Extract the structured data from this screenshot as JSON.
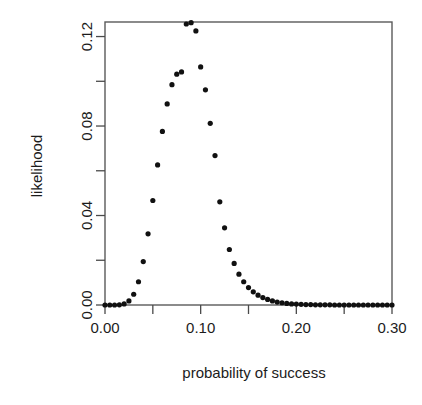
{
  "chart_data": {
    "type": "scatter",
    "title": "",
    "xlabel": "probability of success",
    "ylabel": "likelihood",
    "xlim": [
      0.0,
      0.3
    ],
    "ylim": [
      0.0,
      0.1265
    ],
    "grid": false,
    "legend": null,
    "x_tick_labels": [
      "0.00",
      "0.10",
      "0.20",
      "0.30"
    ],
    "x_tick_values": [
      0.0,
      0.1,
      0.2,
      0.3
    ],
    "x_minor_tick_values": [
      0.05,
      0.15,
      0.25
    ],
    "y_tick_labels": [
      "0.00",
      "0.04",
      "0.08",
      "0.12"
    ],
    "y_tick_values": [
      0.0,
      0.04,
      0.08,
      0.12
    ],
    "y_minor_tick_values": [
      0.02,
      0.06,
      0.1
    ],
    "point_marker": "filled-circle",
    "point_color": "#111111",
    "x": [
      0.0,
      0.005,
      0.01,
      0.015,
      0.02,
      0.025,
      0.03,
      0.035,
      0.04,
      0.045,
      0.05,
      0.055,
      0.06,
      0.065,
      0.07,
      0.075,
      0.08,
      0.085,
      0.09,
      0.095,
      0.1,
      0.105,
      0.11,
      0.115,
      0.12,
      0.125,
      0.13,
      0.135,
      0.14,
      0.145,
      0.15,
      0.155,
      0.16,
      0.165,
      0.17,
      0.175,
      0.18,
      0.185,
      0.19,
      0.195,
      0.2,
      0.205,
      0.21,
      0.215,
      0.22,
      0.225,
      0.23,
      0.235,
      0.24,
      0.245,
      0.25,
      0.255,
      0.26,
      0.265,
      0.27,
      0.275,
      0.28,
      0.285,
      0.29,
      0.295,
      0.3
    ],
    "y": [
      0.0,
      0.0,
      0.0,
      0.0001,
      0.0005,
      0.0018,
      0.0048,
      0.0104,
      0.0194,
      0.0318,
      0.0467,
      0.0626,
      0.0776,
      0.0899,
      0.0985,
      0.1032,
      0.1042,
      0.1256,
      0.1262,
      0.1225,
      0.1064,
      0.0962,
      0.0812,
      0.0668,
      0.0461,
      0.0345,
      0.0248,
      0.0186,
      0.0138,
      0.0104,
      0.0078,
      0.0059,
      0.0044,
      0.0033,
      0.0025,
      0.0018,
      0.0013,
      0.001,
      0.0007,
      0.0005,
      0.0004,
      0.0003,
      0.0002,
      0.0002,
      0.0001,
      0.0001,
      0.0001,
      0.0001,
      0.0,
      0.0,
      0.0,
      0.0,
      0.0,
      0.0,
      0.0,
      0.0,
      0.0,
      0.0,
      0.0,
      0.0,
      0.0
    ]
  }
}
